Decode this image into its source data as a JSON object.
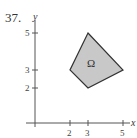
{
  "problem": {
    "number": "37."
  },
  "axes": {
    "x_label": "x",
    "y_label": "y",
    "x_ticks": [
      {
        "value": 2,
        "label": "2"
      },
      {
        "value": 3,
        "label": "3"
      },
      {
        "value": 5,
        "label": "5"
      }
    ],
    "y_ticks": [
      {
        "value": 2,
        "label": "2"
      },
      {
        "value": 3,
        "label": "3"
      },
      {
        "value": 5,
        "label": "5"
      }
    ]
  },
  "region": {
    "label": "Ω",
    "vertices": [
      [
        3,
        5
      ],
      [
        5,
        3
      ],
      [
        3,
        2
      ],
      [
        2,
        3
      ]
    ],
    "fill": "#c8c8c8",
    "stroke": "#333333"
  }
}
